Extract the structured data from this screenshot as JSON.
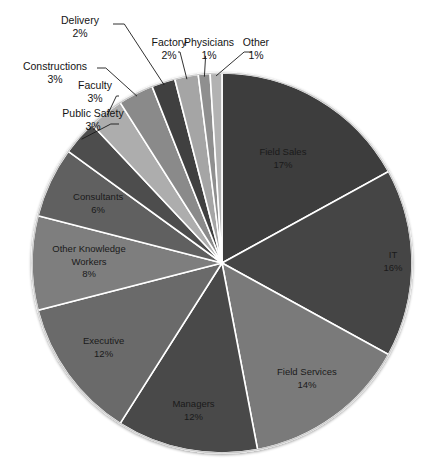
{
  "chart_data": {
    "type": "pie",
    "title": "",
    "subtitle": "",
    "xlabel": "",
    "ylabel": "",
    "legend_position": "none",
    "grid": false,
    "units": "percent",
    "start_angle_deg": 0,
    "direction": "clockwise",
    "total": 100,
    "categories": [
      "Field Sales",
      "IT",
      "Field Services",
      "Managers",
      "Executive",
      "Other Knowledge Workers",
      "Consultants",
      "Public Safety",
      "Faculty",
      "Constructions",
      "Delivery",
      "Factory",
      "Physicians",
      "Other"
    ],
    "values": [
      17,
      16,
      14,
      12,
      12,
      8,
      6,
      3,
      3,
      3,
      2,
      2,
      1,
      1
    ],
    "slices": [
      {
        "label": "Field Sales",
        "value": 17,
        "value_text": "17%",
        "color": "#3c3c3c",
        "label_placement": "inside"
      },
      {
        "label": "IT",
        "value": 16,
        "value_text": "16%",
        "color": "#454545",
        "label_placement": "inside"
      },
      {
        "label": "Field Services",
        "value": 14,
        "value_text": "14%",
        "color": "#7a7a7a",
        "label_placement": "inside"
      },
      {
        "label": "Managers",
        "value": 12,
        "value_text": "12%",
        "color": "#484848",
        "label_placement": "inside"
      },
      {
        "label": "Executive",
        "value": 12,
        "value_text": "12%",
        "color": "#6a6a6a",
        "label_placement": "inside"
      },
      {
        "label": "Other Knowledge Workers",
        "value": 8,
        "value_text": "8%",
        "color": "#7e7e7e",
        "label_placement": "inside"
      },
      {
        "label": "Consultants",
        "value": 6,
        "value_text": "6%",
        "color": "#616161",
        "label_placement": "inside"
      },
      {
        "label": "Public Safety",
        "value": 3,
        "value_text": "3%",
        "color": "#4d4d4d",
        "label_placement": "outside"
      },
      {
        "label": "Faculty",
        "value": 3,
        "value_text": "3%",
        "color": "#adadad",
        "label_placement": "outside"
      },
      {
        "label": "Constructions",
        "value": 3,
        "value_text": "3%",
        "color": "#8a8a8a",
        "label_placement": "outside"
      },
      {
        "label": "Delivery",
        "value": 2,
        "value_text": "2%",
        "color": "#3f3f3f",
        "label_placement": "outside"
      },
      {
        "label": "Factory",
        "value": 2,
        "value_text": "2%",
        "color": "#a5a5a5",
        "label_placement": "outside"
      },
      {
        "label": "Physicians",
        "value": 1,
        "value_text": "1%",
        "color": "#8f8f8f",
        "label_placement": "outside"
      },
      {
        "label": "Other",
        "value": 1,
        "value_text": "1%",
        "color": "#b2b2b2",
        "label_placement": "outside"
      }
    ],
    "separator_color": "#ffffff",
    "background_color": "#ffffff",
    "text_color": "#1a1a1a"
  },
  "inside_labels": {
    "field_sales": {
      "name": "Field Sales",
      "pct": "17%"
    },
    "it": {
      "name": "IT",
      "pct": "16%"
    },
    "field_services": {
      "name": "Field Services",
      "pct": "14%"
    },
    "managers": {
      "name": "Managers",
      "pct": "12%"
    },
    "executive": {
      "name": "Executive",
      "pct": "12%"
    },
    "other_knowledge_workers": {
      "name_line1": "Other Knowledge",
      "name_line2": "Workers",
      "pct": "8%"
    },
    "consultants": {
      "name": "Consultants",
      "pct": "6%"
    }
  },
  "outside_labels": {
    "public_safety": {
      "name": "Public Safety",
      "pct": "3%"
    },
    "faculty": {
      "name": "Faculty",
      "pct": "3%"
    },
    "constructions": {
      "name": "Constructions",
      "pct": "3%"
    },
    "delivery": {
      "name": "Delivery",
      "pct": "2%"
    },
    "factory": {
      "name": "Factory",
      "pct": "2%"
    },
    "physicians": {
      "name": "Physicians",
      "pct": "1%"
    },
    "other": {
      "name": "Other",
      "pct": "1%"
    }
  }
}
